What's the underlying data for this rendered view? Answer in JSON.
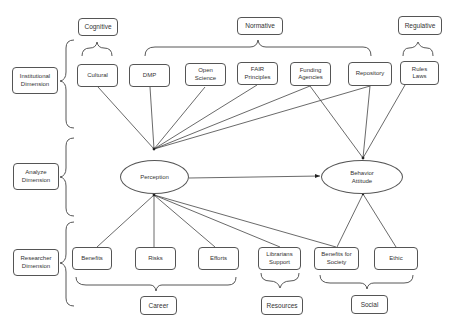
{
  "diagram": {
    "dimensions": [
      {
        "id": "institutional",
        "label": "Institutional\nDimension"
      },
      {
        "id": "analyze",
        "label": "Analyze\nDimension"
      },
      {
        "id": "researcher",
        "label": "Researcher\nDimension"
      }
    ],
    "categories": {
      "cognitive": "Cognitive",
      "normative": "Normative",
      "regulative": "Regulative",
      "career": "Career",
      "resources": "Resources",
      "social": "Social"
    },
    "institutional_factors": [
      {
        "id": "cultural",
        "label": "Cultural"
      },
      {
        "id": "dmp",
        "label": "DMP"
      },
      {
        "id": "open_science",
        "label": "Open\nScience"
      },
      {
        "id": "fair",
        "label": "FAIR\nPrinciples"
      },
      {
        "id": "funding",
        "label": "Funding\nAgencies"
      },
      {
        "id": "repository",
        "label": "Repository"
      },
      {
        "id": "rules",
        "label": "Rules\nLaws"
      }
    ],
    "researcher_factors": [
      {
        "id": "benefits",
        "label": "Benefits"
      },
      {
        "id": "risks",
        "label": "Risks"
      },
      {
        "id": "efforts",
        "label": "Efforts"
      },
      {
        "id": "librarians",
        "label": "Librarians\nSupport"
      },
      {
        "id": "benefits_society",
        "label": "Benefits for\nSociety"
      },
      {
        "id": "ethic",
        "label": "Ethic"
      }
    ],
    "constructs": {
      "perception": "Perception",
      "behavior": "Behavior\nAttitude"
    },
    "edges": [
      [
        "cultural",
        "perception"
      ],
      [
        "dmp",
        "perception"
      ],
      [
        "open_science",
        "perception"
      ],
      [
        "fair",
        "perception"
      ],
      [
        "funding",
        "perception"
      ],
      [
        "repository",
        "perception"
      ],
      [
        "funding",
        "behavior"
      ],
      [
        "repository",
        "behavior"
      ],
      [
        "rules",
        "behavior"
      ],
      [
        "perception",
        "behavior"
      ],
      [
        "perception",
        "benefits"
      ],
      [
        "perception",
        "risks"
      ],
      [
        "perception",
        "efforts"
      ],
      [
        "perception",
        "librarians"
      ],
      [
        "perception",
        "benefits_society"
      ],
      [
        "behavior",
        "benefits_society"
      ],
      [
        "behavior",
        "ethic"
      ]
    ]
  }
}
